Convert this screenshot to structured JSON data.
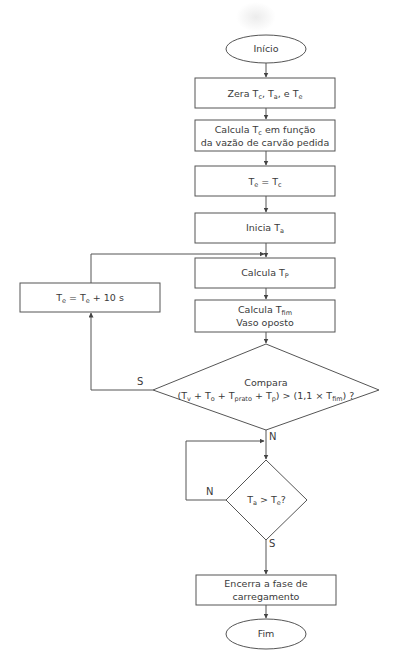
{
  "diagram": {
    "type": "flowchart",
    "colors": {
      "line": "#555555",
      "text": "#3a3a3a",
      "background": "#ffffff"
    },
    "nodes": {
      "start": {
        "shape": "ellipse",
        "label": "Início"
      },
      "zero": {
        "shape": "rect",
        "parts": [
          "Zera T",
          "c",
          ", T",
          "a",
          ", e T",
          "e"
        ]
      },
      "calc_tc": {
        "shape": "rect",
        "line1_parts": [
          "Calcula T",
          "c",
          " em função"
        ],
        "line2": "da vazão de carvão pedida"
      },
      "te_eq_tc": {
        "shape": "rect",
        "parts": [
          "T",
          "e",
          " = T",
          "c"
        ]
      },
      "start_ta": {
        "shape": "rect",
        "parts": [
          "Inicia T",
          "a"
        ]
      },
      "calc_tp": {
        "shape": "rect",
        "parts": [
          "Calcula T",
          "P"
        ]
      },
      "calc_tfim": {
        "shape": "rect",
        "line1_parts": [
          "Calcula T",
          "fim"
        ],
        "line2": "Vaso oposto"
      },
      "increment_te": {
        "shape": "rect",
        "parts": [
          "T",
          "e",
          " = T",
          "e",
          " + 10 s"
        ]
      },
      "compare": {
        "shape": "diamond",
        "line1": "Compara",
        "line2_parts": [
          "(T",
          "v",
          " + T",
          "o",
          " + T",
          "prato",
          " + T",
          "p",
          ") > (1,1 × T",
          "fim",
          ") ?"
        ]
      },
      "ta_gt_te": {
        "shape": "diamond",
        "parts": [
          "T",
          "a",
          " > T",
          "e",
          "?"
        ]
      },
      "end_loading": {
        "shape": "rect",
        "line1": "Encerra a fase de",
        "line2": "carregamento"
      },
      "end": {
        "shape": "ellipse",
        "label": "Fim"
      }
    },
    "edge_labels": {
      "compare_yes": "S",
      "compare_no": "N",
      "ta_no": "N",
      "ta_yes": "S"
    },
    "edges": [
      [
        "start",
        "zero"
      ],
      [
        "zero",
        "calc_tc"
      ],
      [
        "calc_tc",
        "te_eq_tc"
      ],
      [
        "te_eq_tc",
        "start_ta"
      ],
      [
        "start_ta",
        "calc_tp"
      ],
      [
        "calc_tp",
        "calc_tfim"
      ],
      [
        "calc_tfim",
        "compare"
      ],
      [
        "compare",
        "increment_te",
        "S"
      ],
      [
        "increment_te",
        "calc_tp"
      ],
      [
        "compare",
        "ta_gt_te",
        "N"
      ],
      [
        "ta_gt_te",
        "ta_gt_te",
        "N"
      ],
      [
        "ta_gt_te",
        "end_loading",
        "S"
      ],
      [
        "end_loading",
        "end"
      ]
    ]
  }
}
